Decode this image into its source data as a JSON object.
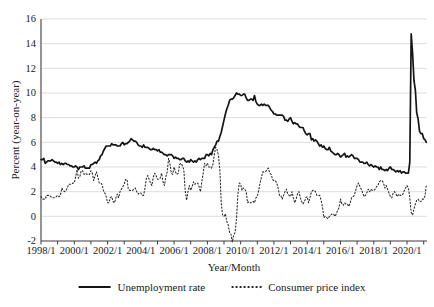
{
  "figure": {
    "background": "#ffffff"
  },
  "colors": {
    "axis": "#3d3d3d",
    "grid": "#d9d9d9",
    "text": "#1a1a1a",
    "line": "#141414"
  },
  "chart_data": {
    "type": "line",
    "title": "",
    "xlabel": "Year/Month",
    "ylabel": "Percent (year-on-year)",
    "ylim": [
      -2,
      16
    ],
    "y_ticks": [
      -2,
      0,
      2,
      4,
      6,
      8,
      10,
      12,
      14,
      16
    ],
    "x_tick_labels": [
      "1998/1",
      "2000/1",
      "2002/1",
      "2004/1",
      "2006/1",
      "2008/1",
      "2010/1",
      "2012/1",
      "2014/1",
      "2016/1",
      "2018/1",
      "2020/1"
    ],
    "x_minor_tick_years": [
      1998,
      1999,
      2000,
      2001,
      2002,
      2003,
      2004,
      2005,
      2006,
      2007,
      2008,
      2009,
      2010,
      2011,
      2012,
      2013,
      2014,
      2015,
      2016,
      2017,
      2018,
      2019,
      2020,
      2021
    ],
    "x_start": "1998/1",
    "x_end": "2021/3",
    "frequency": "monthly",
    "grid": "horizontal",
    "legend_position": "bottom",
    "series": [
      {
        "name": "Unemployment rate",
        "line": "solid",
        "color": "#141414",
        "values": [
          4.6,
          4.6,
          4.7,
          4.3,
          4.4,
          4.5,
          4.5,
          4.5,
          4.6,
          4.5,
          4.4,
          4.4,
          4.3,
          4.4,
          4.2,
          4.3,
          4.2,
          4.3,
          4.3,
          4.2,
          4.2,
          4.1,
          4.1,
          4.0,
          4.0,
          4.1,
          4.0,
          3.8,
          4.0,
          4.0,
          4.0,
          4.1,
          3.9,
          3.9,
          3.9,
          3.9,
          4.2,
          4.2,
          4.3,
          4.4,
          4.3,
          4.5,
          4.6,
          4.9,
          5.0,
          5.3,
          5.5,
          5.7,
          5.7,
          5.7,
          5.7,
          5.9,
          5.8,
          5.8,
          5.8,
          5.7,
          5.7,
          5.7,
          5.9,
          6.0,
          5.8,
          5.9,
          5.9,
          6.0,
          6.1,
          6.3,
          6.2,
          6.1,
          6.1,
          6.0,
          5.8,
          5.7,
          5.7,
          5.6,
          5.8,
          5.6,
          5.6,
          5.6,
          5.5,
          5.4,
          5.4,
          5.5,
          5.4,
          5.4,
          5.3,
          5.4,
          5.2,
          5.2,
          5.1,
          5.0,
          5.0,
          4.9,
          5.0,
          5.0,
          5.0,
          4.9,
          4.7,
          4.8,
          4.7,
          4.7,
          4.6,
          4.6,
          4.7,
          4.7,
          4.5,
          4.4,
          4.5,
          4.4,
          4.6,
          4.5,
          4.4,
          4.5,
          4.4,
          4.6,
          4.7,
          4.6,
          4.7,
          4.7,
          4.7,
          5.0,
          5.0,
          4.9,
          5.1,
          5.0,
          5.4,
          5.6,
          5.8,
          6.1,
          6.1,
          6.5,
          6.8,
          7.3,
          7.8,
          8.3,
          8.7,
          9.0,
          9.4,
          9.5,
          9.5,
          9.6,
          9.8,
          10.0,
          9.9,
          9.9,
          9.8,
          9.8,
          9.9,
          9.9,
          9.6,
          9.4,
          9.4,
          9.5,
          9.5,
          9.4,
          9.8,
          9.3,
          9.1,
          9.0,
          9.0,
          9.1,
          9.0,
          9.1,
          9.0,
          9.0,
          9.0,
          8.8,
          8.6,
          8.5,
          8.3,
          8.3,
          8.2,
          8.2,
          8.2,
          8.2,
          8.2,
          8.1,
          7.8,
          7.8,
          7.7,
          7.9,
          8.0,
          7.7,
          7.5,
          7.6,
          7.5,
          7.5,
          7.3,
          7.2,
          7.2,
          7.2,
          6.9,
          6.7,
          6.6,
          6.7,
          6.7,
          6.2,
          6.3,
          6.1,
          6.2,
          6.1,
          5.9,
          5.7,
          5.8,
          5.6,
          5.7,
          5.5,
          5.4,
          5.4,
          5.6,
          5.3,
          5.2,
          5.1,
          5.0,
          5.0,
          5.1,
          5.0,
          4.8,
          4.9,
          5.0,
          5.1,
          4.8,
          4.9,
          4.8,
          4.9,
          5.0,
          4.9,
          4.7,
          4.7,
          4.7,
          4.6,
          4.4,
          4.4,
          4.4,
          4.3,
          4.3,
          4.4,
          4.2,
          4.1,
          4.2,
          4.1,
          4.0,
          4.1,
          4.0,
          4.0,
          3.8,
          4.0,
          3.8,
          3.8,
          3.7,
          3.8,
          3.7,
          3.9,
          4.0,
          3.8,
          3.8,
          3.7,
          3.6,
          3.7,
          3.6,
          3.7,
          3.5,
          3.6,
          3.6,
          3.5,
          3.5,
          3.5,
          4.4,
          14.8,
          13.2,
          11.0,
          10.2,
          8.4,
          7.9,
          6.9,
          6.7,
          6.7,
          6.3,
          6.2,
          6.0
        ]
      },
      {
        "name": "Consumer price index",
        "line": "dotted",
        "color": "#2b2b2b",
        "values": [
          1.6,
          1.4,
          1.4,
          1.4,
          1.7,
          1.7,
          1.7,
          1.6,
          1.5,
          1.5,
          1.5,
          1.6,
          1.7,
          1.6,
          1.7,
          2.3,
          2.1,
          2.0,
          2.1,
          2.3,
          2.6,
          2.6,
          2.6,
          2.7,
          2.7,
          3.2,
          3.8,
          3.1,
          3.2,
          3.7,
          3.7,
          3.4,
          3.5,
          3.4,
          3.4,
          3.4,
          3.7,
          3.5,
          2.9,
          3.3,
          3.6,
          3.2,
          2.7,
          2.7,
          2.6,
          2.1,
          1.9,
          1.6,
          1.1,
          1.1,
          1.5,
          1.6,
          1.2,
          1.1,
          1.5,
          1.8,
          1.5,
          2.0,
          2.2,
          2.4,
          2.6,
          3.0,
          3.0,
          2.2,
          2.1,
          2.1,
          2.1,
          2.2,
          2.3,
          2.0,
          1.8,
          1.9,
          1.9,
          1.7,
          1.7,
          2.3,
          3.1,
          3.3,
          3.0,
          2.7,
          2.5,
          3.2,
          3.5,
          3.3,
          3.0,
          3.0,
          3.1,
          3.5,
          2.8,
          2.5,
          3.2,
          3.6,
          4.7,
          4.3,
          3.5,
          3.4,
          4.0,
          3.6,
          3.4,
          3.5,
          4.2,
          4.3,
          4.1,
          3.8,
          2.1,
          1.3,
          2.0,
          2.5,
          2.1,
          2.4,
          2.8,
          2.6,
          2.7,
          2.7,
          2.4,
          2.0,
          2.8,
          3.5,
          4.3,
          4.1,
          4.3,
          4.0,
          4.0,
          3.9,
          4.2,
          5.0,
          5.6,
          5.4,
          4.9,
          3.7,
          1.1,
          0.1,
          0.0,
          0.2,
          -0.4,
          -0.7,
          -1.3,
          -1.4,
          -2.1,
          -1.5,
          -1.3,
          -0.2,
          1.8,
          2.7,
          2.6,
          2.1,
          2.3,
          2.2,
          2.0,
          1.1,
          1.2,
          1.1,
          1.1,
          1.2,
          1.1,
          1.5,
          1.6,
          2.1,
          2.7,
          3.2,
          3.6,
          3.6,
          3.6,
          3.8,
          3.9,
          3.5,
          3.4,
          3.0,
          2.9,
          2.9,
          2.7,
          2.3,
          1.7,
          1.7,
          1.4,
          1.7,
          2.0,
          2.2,
          1.8,
          1.7,
          1.6,
          2.0,
          1.5,
          1.1,
          1.4,
          1.8,
          2.0,
          1.5,
          1.2,
          1.0,
          1.2,
          1.5,
          1.6,
          1.1,
          1.5,
          2.0,
          2.1,
          2.1,
          2.0,
          1.7,
          1.7,
          1.7,
          1.3,
          0.8,
          -0.1,
          0.0,
          -0.1,
          -0.2,
          0.0,
          0.1,
          0.2,
          0.2,
          0.0,
          0.2,
          0.5,
          0.7,
          1.4,
          1.0,
          0.9,
          1.1,
          1.0,
          1.0,
          0.8,
          1.1,
          1.5,
          1.6,
          1.7,
          2.1,
          2.5,
          2.7,
          2.4,
          2.2,
          1.9,
          1.6,
          1.7,
          1.9,
          2.2,
          2.0,
          2.2,
          2.1,
          2.1,
          2.2,
          2.4,
          2.5,
          2.8,
          2.9,
          2.9,
          2.7,
          2.3,
          2.5,
          2.2,
          1.9,
          1.6,
          1.5,
          1.9,
          2.0,
          1.8,
          1.6,
          1.8,
          1.7,
          1.7,
          1.8,
          2.1,
          2.3,
          2.5,
          2.3,
          1.5,
          0.3,
          0.1,
          0.6,
          1.0,
          1.3,
          1.4,
          1.2,
          1.2,
          1.4,
          1.4,
          1.7,
          2.6
        ]
      }
    ]
  }
}
